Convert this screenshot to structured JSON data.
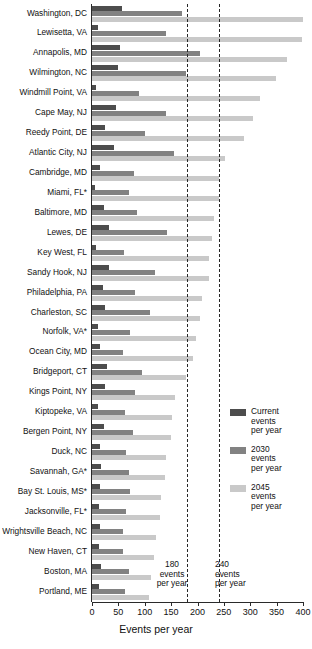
{
  "chart_data": {
    "type": "bar",
    "orientation": "horizontal",
    "title": "",
    "xlabel": "Events per year",
    "ylabel": "",
    "xlim": [
      0,
      400
    ],
    "xticks": [
      0,
      50,
      100,
      150,
      200,
      250,
      300,
      350,
      400
    ],
    "grid": false,
    "legend_position": "right-middle",
    "categories": [
      "Washington, DC",
      "Lewisetta, VA",
      "Annapolis, MD",
      "Wilmington, NC",
      "Windmill Point, VA",
      "Cape May, NJ",
      "Reedy Point, DE",
      "Atlantic City, NJ",
      "Cambridge, MD",
      "Miami, FL*",
      "Baltimore, MD",
      "Lewes, DE",
      "Key West, FL",
      "Sandy Hook, NJ",
      "Philadelphia, PA",
      "Charleston, SC",
      "Norfolk, VA*",
      "Ocean City, MD",
      "Bridgeport, CT",
      "Kings Point, NY",
      "Kiptopeke, VA",
      "Bergen Point, NY",
      "Duck, NC",
      "Savannah, GA*",
      "Bay St. Louis, MS*",
      "Jacksonville, FL*",
      "Wrightsville Beach, NC",
      "New Haven, CT",
      "Boston, MA",
      "Portland, ME"
    ],
    "series": [
      {
        "name": "Current events per year",
        "color": "#4d4d4d",
        "values": [
          57,
          12,
          54,
          50,
          8,
          45,
          24,
          42,
          15,
          6,
          22,
          32,
          7,
          32,
          20,
          25,
          12,
          16,
          28,
          24,
          12,
          22,
          16,
          18,
          16,
          14,
          16,
          13,
          18,
          14
        ]
      },
      {
        "name": "2030 events per year",
        "color": "#828282",
        "values": [
          170,
          140,
          205,
          178,
          90,
          140,
          100,
          155,
          80,
          70,
          85,
          142,
          60,
          120,
          82,
          110,
          72,
          58,
          95,
          82,
          62,
          78,
          65,
          70,
          72,
          64,
          58,
          58,
          70,
          62
        ]
      },
      {
        "name": "2045 events per year",
        "color": "#c9c9c9",
        "values": [
          400,
          398,
          370,
          348,
          318,
          305,
          288,
          253,
          240,
          240,
          232,
          228,
          222,
          222,
          208,
          205,
          198,
          192,
          178,
          158,
          152,
          150,
          140,
          138,
          130,
          128,
          122,
          118,
          112,
          108
        ]
      }
    ],
    "reference_lines": [
      {
        "value": 180,
        "label_lines": [
          "180",
          "events",
          "per year"
        ],
        "style": "dashed"
      },
      {
        "value": 240,
        "label_lines": [
          "240",
          "events",
          "per year"
        ],
        "style": "dashed"
      }
    ]
  },
  "legend": {
    "items": [
      {
        "label_lines": [
          "Current",
          "events",
          "per year"
        ],
        "color": "#4d4d4d",
        "swatch_name": "legend-swatch-current"
      },
      {
        "label_lines": [
          "2030",
          "events",
          "per year"
        ],
        "color": "#828282",
        "swatch_name": "legend-swatch-2030"
      },
      {
        "label_lines": [
          "2045",
          "events",
          "per year"
        ],
        "color": "#c9c9c9",
        "swatch_name": "legend-swatch-2045"
      }
    ]
  }
}
